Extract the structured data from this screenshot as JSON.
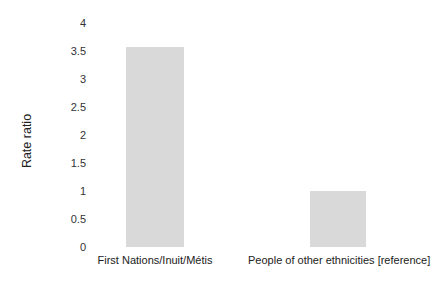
{
  "chart_data": {
    "type": "bar",
    "title": "",
    "xlabel": "",
    "ylabel": "Rate ratio",
    "categories": [
      "First Nations/Inuit/Métis",
      "People of other ethnicities [reference]"
    ],
    "values": [
      3.57,
      1.0
    ],
    "ylim": [
      0,
      4
    ],
    "yticks": [
      "0",
      "0.5",
      "1",
      "1.5",
      "2",
      "2.5",
      "3",
      "3.5",
      "4"
    ],
    "grid": false,
    "legend": null,
    "bar_color": "#d9d9d9"
  }
}
